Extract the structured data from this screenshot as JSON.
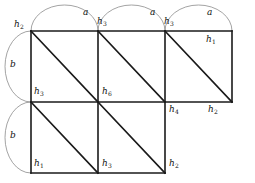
{
  "figure": {
    "colors": {
      "grid_line": "#1a1a1a",
      "diagonal_line": "#1a1a1a",
      "arc_line": "#8c8c8c",
      "text": "#111111",
      "background": "#ffffff"
    },
    "geometry": {
      "cell_size": 67,
      "origin_x": 31,
      "origin_y": 31,
      "top_row_cells": 3,
      "bottom_row_cells": 2
    }
  },
  "arcs": {
    "top": [
      {
        "label": "a",
        "x": 83,
        "y": 8
      },
      {
        "label": "a",
        "x": 150,
        "y": 8
      },
      {
        "label": "a",
        "x": 207,
        "y": 8
      }
    ],
    "left": [
      {
        "label": "b",
        "x": 10,
        "y": 60
      },
      {
        "label": "b",
        "x": 10,
        "y": 131
      }
    ]
  },
  "vertices": [
    {
      "name": "h2",
      "base": "h",
      "sub": "2",
      "x": 14,
      "y": 20
    },
    {
      "name": "h3",
      "base": "h",
      "sub": "3",
      "x": 97,
      "y": 17
    },
    {
      "name": "h3",
      "base": "h",
      "sub": "3",
      "x": 164,
      "y": 17
    },
    {
      "name": "h1",
      "base": "h",
      "sub": "1",
      "x": 206,
      "y": 35
    },
    {
      "name": "h3",
      "base": "h",
      "sub": "3",
      "x": 34,
      "y": 87
    },
    {
      "name": "h6",
      "base": "h",
      "sub": "6",
      "x": 102,
      "y": 87
    },
    {
      "name": "h4",
      "base": "h",
      "sub": "4",
      "x": 169,
      "y": 105
    },
    {
      "name": "h2",
      "base": "h",
      "sub": "2",
      "x": 208,
      "y": 105
    },
    {
      "name": "h1",
      "base": "h",
      "sub": "1",
      "x": 34,
      "y": 159
    },
    {
      "name": "h3",
      "base": "h",
      "sub": "3",
      "x": 102,
      "y": 159
    },
    {
      "name": "h2",
      "base": "h",
      "sub": "2",
      "x": 169,
      "y": 159
    }
  ]
}
